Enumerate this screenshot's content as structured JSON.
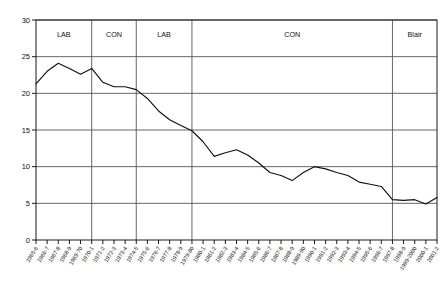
{
  "chart_data": {
    "type": "line",
    "title": "",
    "xlabel": "",
    "ylabel": "",
    "ylim": [
      0,
      30
    ],
    "ytick_step": 5,
    "yticks": [
      "0",
      "5",
      "10",
      "15",
      "20",
      "25",
      "30"
    ],
    "grid": "horizontal",
    "legend": "none",
    "line_color": "#111111",
    "gridline_color": "#555555",
    "background": "#ffffff",
    "categories": [
      "1965-6",
      "1966-7",
      "1967-8",
      "1968-9",
      "1969-70",
      "1970-1",
      "1971-2",
      "1972-3",
      "1973-4",
      "1974-5",
      "1975-6",
      "1976-7",
      "1977-8",
      "1978-9",
      "1979-80",
      "1980-1",
      "1981-2",
      "1982-3",
      "1983-4",
      "1984-5",
      "1985-6",
      "1986-7",
      "1987-8",
      "1988-9",
      "1989-90",
      "1990-1",
      "1991-2",
      "1992-3",
      "1993-4",
      "1994-5",
      "1995-6",
      "1996-7",
      "1997-8",
      "1998-9",
      "1999-2000",
      "2000-1",
      "2001-2"
    ],
    "values": [
      21.3,
      23.0,
      24.1,
      23.4,
      22.6,
      23.4,
      21.5,
      20.9,
      20.9,
      20.5,
      19.3,
      17.6,
      16.4,
      15.6,
      14.9,
      13.4,
      11.4,
      11.9,
      12.3,
      11.6,
      10.5,
      9.2,
      8.8,
      8.1,
      9.2,
      10.0,
      9.7,
      9.2,
      8.8,
      7.9,
      7.6,
      7.3,
      5.5,
      5.4,
      5.5,
      4.9,
      5.8
    ],
    "annotations": [
      {
        "label": "LAB",
        "start": "1965-6",
        "end": "1970-1"
      },
      {
        "label": "CON",
        "start": "1970-1",
        "end": "1974-5"
      },
      {
        "label": "LAB",
        "start": "1974-5",
        "end": "1979-80"
      },
      {
        "label": "CON",
        "start": "1979-80",
        "end": "1997-8"
      },
      {
        "label": "Blair",
        "start": "1997-8",
        "end": "2001-2"
      }
    ]
  }
}
